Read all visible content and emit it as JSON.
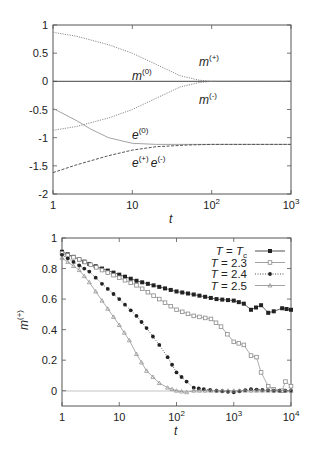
{
  "chart_data": [
    {
      "type": "line",
      "title": "",
      "xlabel": "t",
      "ylabel": "",
      "xscale": "log",
      "xlim": [
        1,
        1000
      ],
      "ylim": [
        -2,
        1
      ],
      "xticks": [
        "1",
        "10",
        "10^2",
        "10^3"
      ],
      "yticks": [
        "1",
        "0.5",
        "0",
        "-0.5",
        "-1",
        "-1.5",
        "-2"
      ],
      "grid": false,
      "annotations": [
        "m(+)",
        "m(0)",
        "m(-)",
        "e(0)",
        "e(+) e(-)"
      ],
      "series": [
        {
          "name": "m(+)",
          "style": "dotted",
          "x": [
            1,
            2,
            5,
            10,
            20,
            40,
            70,
            100,
            1000
          ],
          "values": [
            0.87,
            0.8,
            0.65,
            0.5,
            0.3,
            0.1,
            0.02,
            0.0,
            0.0
          ]
        },
        {
          "name": "m(0)",
          "style": "solid",
          "x": [
            1,
            10,
            100,
            1000
          ],
          "values": [
            0.0,
            0.0,
            0.0,
            0.0
          ]
        },
        {
          "name": "m(-)",
          "style": "dotted",
          "x": [
            1,
            2,
            5,
            10,
            20,
            40,
            70,
            100,
            1000
          ],
          "values": [
            -0.87,
            -0.8,
            -0.65,
            -0.5,
            -0.3,
            -0.1,
            -0.02,
            0.0,
            0.0
          ]
        },
        {
          "name": "e(0)",
          "style": "solid-light",
          "x": [
            1,
            2,
            3,
            5,
            10,
            20,
            50,
            100,
            1000
          ],
          "values": [
            -0.48,
            -0.7,
            -0.85,
            -1.0,
            -1.1,
            -1.12,
            -1.12,
            -1.12,
            -1.12
          ]
        },
        {
          "name": "e(+) e(-)",
          "style": "dashed",
          "x": [
            1,
            2,
            5,
            10,
            20,
            50,
            100,
            1000
          ],
          "values": [
            -1.62,
            -1.48,
            -1.32,
            -1.22,
            -1.16,
            -1.13,
            -1.12,
            -1.12
          ]
        }
      ]
    },
    {
      "type": "line",
      "title": "",
      "xlabel": "t",
      "ylabel": "m(+)",
      "xscale": "log",
      "xlim": [
        1,
        10000
      ],
      "ylim": [
        -0.1,
        1
      ],
      "xticks": [
        "1",
        "10",
        "10^2",
        "10^3",
        "10^4"
      ],
      "yticks": [
        "1",
        "0.8",
        "0.6",
        "0.4",
        "0.2",
        "0"
      ],
      "grid": false,
      "legend_position": "top-right",
      "series": [
        {
          "name": "T = Tc",
          "marker": "filled-square",
          "x": [
            1,
            2,
            3,
            5,
            10,
            20,
            50,
            100,
            200,
            500,
            1000,
            1500,
            2000,
            3000,
            4000,
            5000,
            7000,
            10000
          ],
          "values": [
            0.91,
            0.86,
            0.83,
            0.8,
            0.76,
            0.72,
            0.68,
            0.65,
            0.63,
            0.6,
            0.59,
            0.57,
            0.53,
            0.56,
            0.51,
            0.52,
            0.54,
            0.53
          ]
        },
        {
          "name": "T = 2.3",
          "marker": "open-square",
          "x": [
            1,
            2,
            5,
            10,
            20,
            50,
            100,
            200,
            400,
            600,
            1000,
            1500,
            2000,
            2500,
            3000,
            4000,
            5000,
            7000,
            8000,
            10000
          ],
          "values": [
            0.9,
            0.86,
            0.79,
            0.74,
            0.69,
            0.6,
            0.53,
            0.49,
            0.47,
            0.42,
            0.32,
            0.3,
            0.23,
            0.22,
            0.12,
            0.03,
            0.01,
            0.0,
            0.06,
            0.03
          ]
        },
        {
          "name": "T = 2.4",
          "marker": "filled-circle",
          "x": [
            1,
            2,
            3,
            5,
            10,
            20,
            30,
            50,
            70,
            100,
            150,
            200,
            300,
            500,
            1000,
            2000,
            5000,
            10000
          ],
          "values": [
            0.89,
            0.82,
            0.78,
            0.7,
            0.6,
            0.49,
            0.41,
            0.3,
            0.22,
            0.12,
            0.06,
            0.02,
            0.01,
            0.0,
            -0.01,
            0.01,
            0.0,
            0.0
          ]
        },
        {
          "name": "T = 2.5",
          "marker": "triangle",
          "x": [
            1,
            2,
            3,
            5,
            10,
            15,
            20,
            30,
            50,
            70,
            100,
            150,
            200,
            500,
            1000,
            10000
          ],
          "values": [
            0.87,
            0.79,
            0.71,
            0.59,
            0.43,
            0.33,
            0.24,
            0.13,
            0.05,
            0.02,
            0.0,
            -0.01,
            0.0,
            0.0,
            0.0,
            0.0
          ]
        }
      ]
    }
  ],
  "top_plot": {
    "yticks": [
      "1",
      "0.5",
      "0",
      "-0.5",
      "-1",
      "-1.5",
      "-2"
    ],
    "xticks": [
      {
        "base": "1",
        "exp": ""
      },
      {
        "base": "10",
        "exp": ""
      },
      {
        "base": "10",
        "exp": "2"
      },
      {
        "base": "10",
        "exp": "3"
      }
    ],
    "xlabel": "t",
    "labels": {
      "m_plus": {
        "base": "m",
        "sup": "(+)"
      },
      "m_zero": {
        "base": "m",
        "sup": "(0)"
      },
      "m_minus": {
        "base": "m",
        "sup": "(-)"
      },
      "e_zero": {
        "base": "e",
        "sup": "(0)"
      },
      "e_plus": {
        "base": "e",
        "sup": "(+)"
      },
      "e_minus": {
        "base": "e",
        "sup": "(-)"
      }
    }
  },
  "bottom_plot": {
    "yticks": [
      "1",
      "0.8",
      "0.6",
      "0.4",
      "0.2",
      "0"
    ],
    "xticks": [
      {
        "base": "1",
        "exp": ""
      },
      {
        "base": "10",
        "exp": ""
      },
      {
        "base": "10",
        "exp": "2"
      },
      {
        "base": "10",
        "exp": "3"
      },
      {
        "base": "10",
        "exp": "4"
      }
    ],
    "xlabel": "t",
    "ylabel": {
      "base": "m",
      "sup": "(+)"
    },
    "legend": [
      {
        "prefix": "T = ",
        "value": "T",
        "sub": "c"
      },
      {
        "prefix": "T = ",
        "value": "2.3",
        "sub": ""
      },
      {
        "prefix": "T = ",
        "value": "2.4",
        "sub": ""
      },
      {
        "prefix": "T = ",
        "value": "2.5",
        "sub": ""
      }
    ]
  },
  "colors": {
    "axis": "#555555",
    "dark_series": "#222222",
    "light_series": "#8a8a8a"
  }
}
